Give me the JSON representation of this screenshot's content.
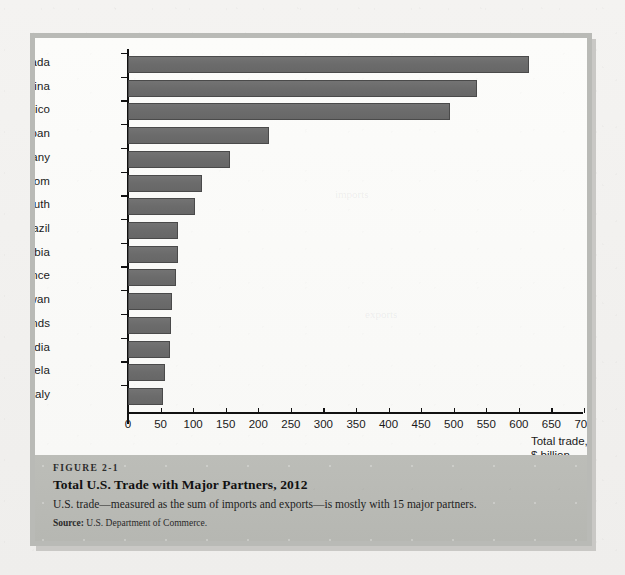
{
  "figure": {
    "number": "FIGURE 2-1",
    "title": "Total U.S. Trade with Major Partners, 2012",
    "description": "U.S. trade—measured as the sum of imports and exports—is mostly with 15 major partners.",
    "source_label": "Source:",
    "source_text": "U.S. Department of Commerce."
  },
  "chart_data": {
    "type": "bar",
    "orientation": "horizontal",
    "title": "Total U.S. Trade with Major Partners, 2012",
    "subtitle": "",
    "xlabel": "Total trade, $ billion",
    "ylabel": "",
    "xlim": [
      0,
      700
    ],
    "xticks": [
      0,
      50,
      100,
      150,
      200,
      250,
      300,
      350,
      400,
      450,
      500,
      550,
      600,
      650,
      700
    ],
    "grid": false,
    "legend": null,
    "bar_color": "#6e6e6e",
    "bar_edge_color": "#4a4a4a",
    "categories": [
      "Canada",
      "China",
      "Mexico",
      "Japan",
      "Germany",
      "United Kingdom",
      "Korea, South",
      "Brazil",
      "Saudi Arabia",
      "France",
      "Taiwan",
      "Netherlands",
      "India",
      "Venezuela",
      "Italy"
    ],
    "values": [
      616,
      536,
      494,
      216,
      157,
      113,
      103,
      77,
      76,
      74,
      67,
      66,
      64,
      57,
      54
    ]
  },
  "axis_title_lines": [
    "Total trade,",
    "$ billion"
  ]
}
